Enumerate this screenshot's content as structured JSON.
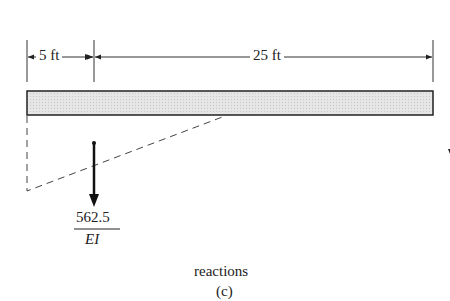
{
  "dimensions": {
    "left_span": "5 ft",
    "right_span": "25 ft"
  },
  "load": {
    "numerator": "562.5",
    "denominator": "EI"
  },
  "caption": {
    "title": "reactions",
    "label": "(c)"
  },
  "colors": {
    "beam_fill": "#e2e2e2",
    "line": "#222222"
  }
}
